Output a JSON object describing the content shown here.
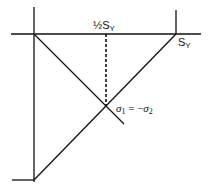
{
  "diagram": {
    "type": "yield-locus-construction",
    "labels": {
      "half_sy_prefix": "½S",
      "half_sy_sub": "Y",
      "sy_main": "S",
      "sy_sub": "Y",
      "sigma1": "σ",
      "sigma1_sub": "1",
      "equals": " = −",
      "sigma2": "σ",
      "sigma2_sub": "2"
    },
    "colors": {
      "line": "#111111",
      "background": "#ffffff"
    },
    "elements": [
      "vertical axis",
      "horizontal axis at top",
      "right tick at S_Y",
      "bottom-left tick",
      "diagonal from origin down-right",
      "diagonal from bottom-left up to S_Y",
      "dashed vertical from ½S_Y to intersection"
    ]
  }
}
